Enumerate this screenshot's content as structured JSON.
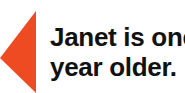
{
  "image": {
    "type": "callout-annotation",
    "background_color": "#FFFFFF"
  },
  "pointer": {
    "icon_name": "left-pointing-triangle-arrow",
    "color": "#EF4B23",
    "direction": "left"
  },
  "caption": {
    "lines": [
      "Janet is one",
      "year older."
    ],
    "full_text": "Janet is one year older.",
    "color": "#111111"
  }
}
